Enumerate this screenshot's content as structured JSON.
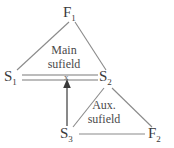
{
  "diagram": {
    "type": "su-field-model",
    "nodes": [
      {
        "id": "F1",
        "base": "F",
        "sub": "1",
        "x": 63,
        "y": 5
      },
      {
        "id": "S1",
        "base": "S",
        "sub": "1",
        "x": 4,
        "y": 69
      },
      {
        "id": "S2",
        "base": "S",
        "sub": "2",
        "x": 99,
        "y": 69
      },
      {
        "id": "S3",
        "base": "S",
        "sub": "3",
        "x": 60,
        "y": 126
      },
      {
        "id": "F2",
        "base": "F",
        "sub": "2",
        "x": 148,
        "y": 126
      }
    ],
    "labels": {
      "main_field_line1": "Main",
      "main_field_line2": "sufield",
      "aux_field_line1": "Aux.",
      "aux_field_line2": "sufield",
      "interaction_mark": "x"
    },
    "colors": {
      "background": "#ffffff",
      "line": "#8a8a8a",
      "double_line": "#7a7a7a",
      "arrow": "#4a4a4a",
      "text": "#3a3a3a",
      "field_text": "#4a4a4a"
    }
  }
}
